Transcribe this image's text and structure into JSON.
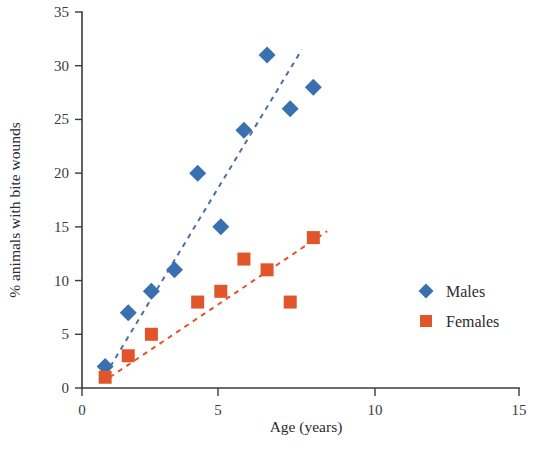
{
  "chart_data": {
    "type": "scatter",
    "title": "",
    "xlabel": "Age (years)",
    "ylabel": "% animals with bite wounds",
    "xlim": [
      0,
      15
    ],
    "ylim": [
      0,
      35
    ],
    "xticks": [
      0,
      5,
      10,
      15
    ],
    "yticks": [
      0,
      5,
      10,
      15,
      20,
      25,
      30,
      35
    ],
    "xtick_labels": [
      "0",
      "5",
      "10",
      "15"
    ],
    "ytick_labels": [
      "0",
      "5",
      "10",
      "15",
      "20",
      "25",
      "30",
      "35"
    ],
    "grid": false,
    "legend_position": "right-middle",
    "series": [
      {
        "name": "Males",
        "marker": "diamond",
        "color": "#3a6fb0",
        "trendline": {
          "style": "dashed",
          "color": "#4a6fa5",
          "x": [
            1.0,
            9.5
          ],
          "y": [
            1.2,
            31.5
          ]
        },
        "points": [
          {
            "x": 1,
            "y": 2
          },
          {
            "x": 2,
            "y": 7
          },
          {
            "x": 3,
            "y": 9
          },
          {
            "x": 4,
            "y": 11
          },
          {
            "x": 5,
            "y": 20
          },
          {
            "x": 6,
            "y": 15
          },
          {
            "x": 7,
            "y": 24
          },
          {
            "x": 8,
            "y": 31
          },
          {
            "x": 9,
            "y": 26
          },
          {
            "x": 10,
            "y": 28
          }
        ]
      },
      {
        "name": "Females",
        "marker": "square",
        "color": "#e0562a",
        "trendline": {
          "style": "dashed",
          "color": "#e0562a",
          "x": [
            1.2,
            10.6
          ],
          "y": [
            1.0,
            14.6
          ]
        },
        "points": [
          {
            "x": 1,
            "y": 1
          },
          {
            "x": 2,
            "y": 3
          },
          {
            "x": 3,
            "y": 5
          },
          {
            "x": 5,
            "y": 8
          },
          {
            "x": 6,
            "y": 9
          },
          {
            "x": 7,
            "y": 12
          },
          {
            "x": 8,
            "y": 11
          },
          {
            "x": 9,
            "y": 8
          },
          {
            "x": 10,
            "y": 14
          }
        ]
      }
    ],
    "legend": [
      {
        "label": "Males",
        "marker": "diamond",
        "color": "#3a6fb0"
      },
      {
        "label": "Females",
        "marker": "square",
        "color": "#e0562a"
      }
    ],
    "colors": {
      "males": "#3a6fb0",
      "females": "#e0562a",
      "axis": "#3b3b40",
      "text": "#2b2b32",
      "background": "#ffffff"
    }
  }
}
